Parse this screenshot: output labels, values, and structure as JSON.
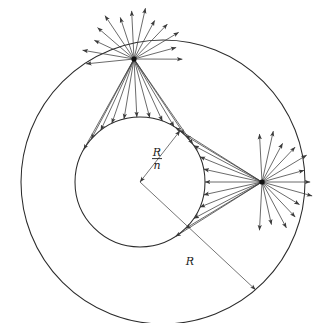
{
  "figure": {
    "background_color": "#ffffff",
    "line_color": "#2b2b2b",
    "ray_color": "#3a3a3a",
    "vertex_color": "#111111",
    "width": 319,
    "height": 323
  },
  "labels": {
    "inner_radius_numerator": "R",
    "inner_radius_denominator": "n",
    "outer_radius": "R"
  },
  "geometry": {
    "outer_circle": {
      "cx": 163,
      "cy": 182,
      "r": 142
    },
    "inner_circle": {
      "cx": 140,
      "cy": 182,
      "r": 65
    },
    "sources": [
      {
        "name": "top-source",
        "x": 134,
        "y": 59
      },
      {
        "name": "right-source",
        "x": 262,
        "y": 182
      }
    ],
    "center_point": {
      "x": 140,
      "y": 182
    },
    "inner_label_anchor": {
      "x": 157,
      "y": 156
    },
    "outer_label_anchor": {
      "x": 190,
      "y": 265
    }
  },
  "rays": {
    "top_source_outward_count": 13,
    "top_source_inward_count": 11,
    "right_source_outward_count": 13,
    "right_source_inward_count": 11,
    "outward_length": 48,
    "arrowhead_length": 5.5,
    "arrowhead_halfwidth": 2.0
  },
  "measures": [
    {
      "name": "inner-radius-measure",
      "label_numerator": "R",
      "label_denominator": "n",
      "from": {
        "x": 140,
        "y": 182
      },
      "to_angle_deg": -52,
      "double_headed": true
    },
    {
      "name": "outer-radius-measure",
      "label": "R",
      "from": {
        "x": 140,
        "y": 182
      },
      "to_angle_deg": 43,
      "double_headed": false
    }
  ]
}
